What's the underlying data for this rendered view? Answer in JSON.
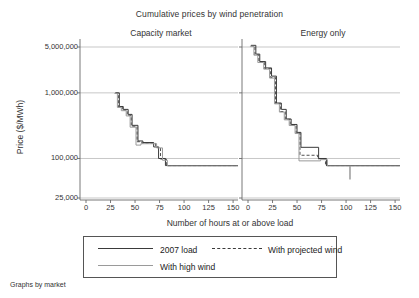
{
  "chart_data": {
    "type": "line",
    "title": "Cumulative prices by wind penetration",
    "xlabel": "Number of hours at or above load",
    "ylabel": "Price ($/MWh)",
    "yscale": "log",
    "ylim": [
      25000,
      6000000
    ],
    "xlim": [
      0,
      155
    ],
    "yticks": [
      5000000,
      1000000,
      100000,
      25000
    ],
    "ytick_labels": [
      "5,000,000",
      "1,000,000",
      "100,000",
      "25,000"
    ],
    "xticks": [
      0,
      25,
      50,
      75,
      100,
      125,
      150
    ],
    "xtick_labels": [
      "0",
      "25",
      "50",
      "75",
      "100",
      "125",
      "150"
    ],
    "grid": "horizontal",
    "legend_position": "bottom",
    "footnote": "Graphs by market",
    "panels": [
      {
        "name": "Capacity market",
        "series": [
          {
            "name": "2007 load",
            "style": "solid",
            "color": "#3a3a3a",
            "points": [
              [
                30,
                1000000
              ],
              [
                34,
                1000000
              ],
              [
                34,
                620000
              ],
              [
                38,
                620000
              ],
              [
                38,
                560000
              ],
              [
                43,
                560000
              ],
              [
                43,
                470000
              ],
              [
                47,
                470000
              ],
              [
                47,
                320000
              ],
              [
                53,
                320000
              ],
              [
                53,
                185000
              ],
              [
                58,
                185000
              ],
              [
                58,
                175000
              ],
              [
                69,
                175000
              ],
              [
                69,
                150000
              ],
              [
                74,
                150000
              ],
              [
                74,
                100000
              ],
              [
                81,
                100000
              ],
              [
                81,
                78000
              ],
              [
                155,
                78000
              ]
            ]
          },
          {
            "name": "With projected wind",
            "style": "dashed",
            "color": "#3a3a3a",
            "points": [
              [
                30,
                990000
              ],
              [
                33,
                990000
              ],
              [
                33,
                610000
              ],
              [
                37,
                610000
              ],
              [
                37,
                545000
              ],
              [
                42,
                545000
              ],
              [
                42,
                455000
              ],
              [
                46,
                455000
              ],
              [
                46,
                310000
              ],
              [
                52,
                310000
              ],
              [
                52,
                180000
              ],
              [
                57,
                180000
              ],
              [
                57,
                172000
              ],
              [
                71,
                172000
              ],
              [
                71,
                148000
              ],
              [
                76,
                148000
              ],
              [
                76,
                98000
              ],
              [
                82,
                98000
              ],
              [
                82,
                78000
              ],
              [
                155,
                78000
              ]
            ]
          },
          {
            "name": "With high wind",
            "style": "solid",
            "color": "#9a9a9a",
            "points": [
              [
                29,
                980000
              ],
              [
                32,
                980000
              ],
              [
                32,
                600000
              ],
              [
                36,
                600000
              ],
              [
                36,
                535000
              ],
              [
                41,
                535000
              ],
              [
                41,
                445000
              ],
              [
                45,
                445000
              ],
              [
                45,
                300000
              ],
              [
                51,
                300000
              ],
              [
                51,
                160000
              ],
              [
                56,
                160000
              ],
              [
                56,
                168000
              ],
              [
                72,
                168000
              ],
              [
                72,
                145000
              ],
              [
                78,
                145000
              ],
              [
                78,
                94000
              ],
              [
                83,
                94000
              ],
              [
                83,
                77000
              ],
              [
                155,
                77000
              ]
            ]
          }
        ]
      },
      {
        "name": "Energy only",
        "series": [
          {
            "name": "2007 load",
            "style": "solid",
            "color": "#3a3a3a",
            "points": [
              [
                3,
                5300000
              ],
              [
                8,
                5300000
              ],
              [
                8,
                3900000
              ],
              [
                12,
                3900000
              ],
              [
                12,
                3000000
              ],
              [
                18,
                3000000
              ],
              [
                18,
                2400000
              ],
              [
                24,
                2400000
              ],
              [
                24,
                1800000
              ],
              [
                29,
                1800000
              ],
              [
                29,
                700000
              ],
              [
                34,
                700000
              ],
              [
                34,
                560000
              ],
              [
                39,
                560000
              ],
              [
                39,
                400000
              ],
              [
                44,
                400000
              ],
              [
                44,
                330000
              ],
              [
                50,
                330000
              ],
              [
                50,
                250000
              ],
              [
                54,
                250000
              ],
              [
                54,
                148000
              ],
              [
                72,
                148000
              ],
              [
                72,
                100000
              ],
              [
                80,
                100000
              ],
              [
                80,
                78000
              ],
              [
                155,
                78000
              ]
            ]
          },
          {
            "name": "With projected wind",
            "style": "dashed",
            "color": "#3a3a3a",
            "points": [
              [
                3,
                5200000
              ],
              [
                7,
                5200000
              ],
              [
                7,
                3800000
              ],
              [
                11,
                3800000
              ],
              [
                11,
                2950000
              ],
              [
                17,
                2950000
              ],
              [
                17,
                2350000
              ],
              [
                23,
                2350000
              ],
              [
                23,
                1720000
              ],
              [
                28,
                1720000
              ],
              [
                28,
                690000
              ],
              [
                33,
                690000
              ],
              [
                33,
                520000
              ],
              [
                38,
                520000
              ],
              [
                38,
                395000
              ],
              [
                43,
                395000
              ],
              [
                43,
                325000
              ],
              [
                49,
                325000
              ],
              [
                49,
                245000
              ],
              [
                53,
                245000
              ],
              [
                53,
                112000
              ],
              [
                71,
                112000
              ],
              [
                71,
                99000
              ],
              [
                79,
                99000
              ],
              [
                79,
                78000
              ],
              [
                155,
                78000
              ]
            ]
          },
          {
            "name": "With high wind",
            "style": "solid",
            "color": "#9a9a9a",
            "points": [
              [
                2,
                5150000
              ],
              [
                6,
                5150000
              ],
              [
                6,
                3750000
              ],
              [
                10,
                3750000
              ],
              [
                10,
                2900000
              ],
              [
                16,
                2900000
              ],
              [
                16,
                2300000
              ],
              [
                22,
                2300000
              ],
              [
                22,
                1680000
              ],
              [
                27,
                1680000
              ],
              [
                27,
                680000
              ],
              [
                32,
                680000
              ],
              [
                32,
                510000
              ],
              [
                37,
                510000
              ],
              [
                37,
                388000
              ],
              [
                42,
                388000
              ],
              [
                42,
                318000
              ],
              [
                48,
                318000
              ],
              [
                48,
                240000
              ],
              [
                52,
                240000
              ],
              [
                52,
                92000
              ],
              [
                74,
                92000
              ],
              [
                74,
                96000
              ],
              [
                81,
                96000
              ],
              [
                81,
                77000
              ],
              [
                104,
                77000
              ],
              [
                104,
                48000
              ],
              [
                104,
                77000
              ],
              [
                155,
                77000
              ]
            ]
          }
        ],
        "annotations": [
          {
            "type": "spike",
            "x": 104,
            "from": 77000,
            "to": 48000
          }
        ]
      }
    ],
    "legend": [
      {
        "label": "2007 load",
        "style": "solid",
        "color": "#3a3a3a"
      },
      {
        "label": "With projected wind",
        "style": "dashed",
        "color": "#3a3a3a"
      },
      {
        "label": "With high wind",
        "style": "solid",
        "color": "#9a9a9a"
      }
    ]
  }
}
